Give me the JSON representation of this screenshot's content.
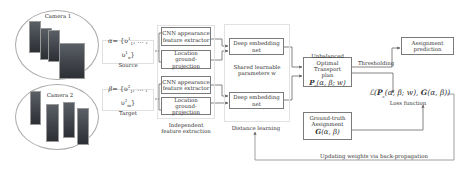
{
  "cameras": [
    {
      "label": "Camera 1"
    },
    {
      "label": "Camera 2"
    }
  ],
  "source": {
    "expr_lhs": "α",
    "expr_rhs": "= {υ",
    "expr_tail": ", … , υ",
    "sup": "1",
    "sub_first": "1",
    "sub_last": "n",
    "caption": "Source"
  },
  "target": {
    "expr_lhs": "β",
    "expr_rhs": "= {υ",
    "expr_tail": ", … , υ",
    "sup": "2",
    "sub_first": "1",
    "sub_last": "m",
    "caption": "Target"
  },
  "feature_extraction": {
    "cnn_label_line1": "CNN appearance",
    "cnn_label_line2": "feature extractor",
    "loc_label_line1": "Location",
    "loc_label_line2": "ground-projection",
    "group_caption_line1": "Independent",
    "group_caption_line2": "feature extraction"
  },
  "distance_learning": {
    "embed_line1": "Deep embedding",
    "embed_line2": "net",
    "shared_line1": "Shared learnable",
    "shared_line2": "parameters w",
    "group_caption": "Distance learning"
  },
  "uot": {
    "line1": "Unbalanced",
    "line2": "Optimal Transport",
    "line3": "plan",
    "formula": "P",
    "formula_sub": "ε",
    "formula_args": "(α, β; w)"
  },
  "thresholding_label": "Thresholding",
  "assignment_prediction": {
    "line1": "Assignment",
    "line2": "prediction"
  },
  "ground_truth": {
    "line1": "Ground-truth",
    "line2": "Assignment",
    "formula": "G",
    "formula_args": "(α, β)"
  },
  "loss": {
    "prefix": "ℒ(",
    "p": "P",
    "p_sub": "ε",
    "p_args": "(α, β; w), ",
    "g": "G",
    "g_args": "(α, β))",
    "caption": "Loss function"
  },
  "backprop_label": "Updating weights via back-propagation"
}
